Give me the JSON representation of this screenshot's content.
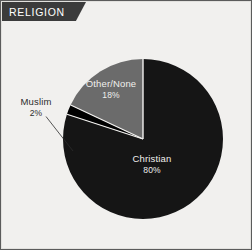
{
  "header": {
    "title": "RELIGION"
  },
  "colors": {
    "background": "#f1f0ee",
    "border": "#5b5b5b",
    "banner": "#3b3b3b",
    "banner_text": "#ffffff",
    "christian": "#151515",
    "other_none": "#6b6b6b",
    "muslim": "#000000",
    "slice_divider": "#f1f0ee",
    "label_light": "#f0efed",
    "label_dark": "#2c2c2c"
  },
  "labels": {
    "christian_name": "Christian",
    "christian_pct": "80%",
    "other_name": "Other/None",
    "other_pct": "18%",
    "muslim_name": "Muslim",
    "muslim_pct": "2%"
  },
  "chart_data": {
    "type": "pie",
    "title": "RELIGION",
    "subtitle": "",
    "xlabel": "",
    "ylabel": "",
    "grid": false,
    "legend": "none",
    "labels_position": "inside-and-callout",
    "start_angle_deg": 0,
    "direction": "clockwise",
    "center": [
      142,
      138
    ],
    "radius": 80,
    "categories": [
      "Christian",
      "Other/None",
      "Muslim"
    ],
    "values": [
      80,
      18,
      2
    ],
    "value_labels": [
      "80%",
      "18%",
      "2%"
    ],
    "colors": [
      "#151515",
      "#6b6b6b",
      "#000000"
    ],
    "annotations": [
      {
        "text": "Muslim",
        "type": "callout",
        "target": "Muslim"
      },
      {
        "text": "2%",
        "type": "callout",
        "target": "Muslim"
      }
    ]
  }
}
